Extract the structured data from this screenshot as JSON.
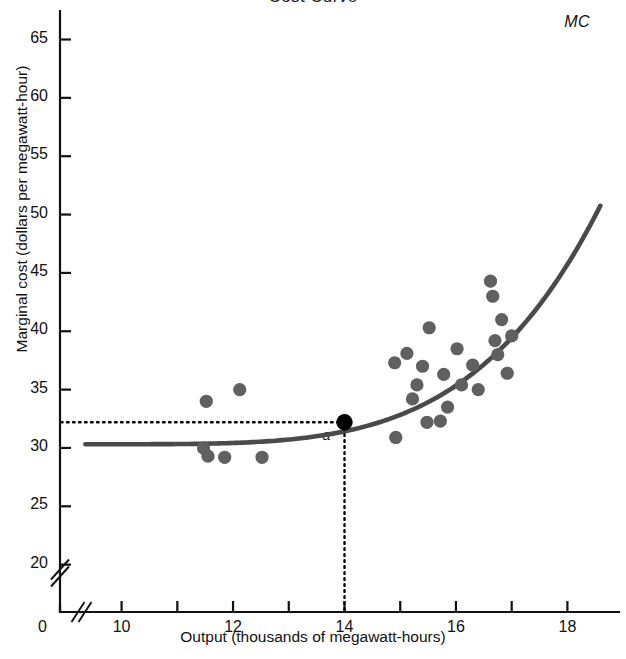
{
  "chart_data": {
    "type": "scatter",
    "title": "Cost Curve",
    "xlabel": "Output (thousands of megawatt-hours)",
    "ylabel": "Marginal cost (dollars per megawatt-hour)",
    "xlim": [
      9.2,
      18.8
    ],
    "ylim": [
      18.0,
      66.5
    ],
    "x_ticks": [
      10,
      11,
      12,
      13,
      14,
      15,
      16,
      17,
      18
    ],
    "x_tick_labels": [
      "10",
      "",
      "12",
      "",
      "14",
      "",
      "16",
      "",
      "18"
    ],
    "y_ticks": [
      20,
      25,
      30,
      35,
      40,
      45,
      50,
      55,
      60,
      65
    ],
    "y_tick_labels": [
      "20",
      "25",
      "30",
      "35",
      "40",
      "45",
      "50",
      "55",
      "60",
      "65"
    ],
    "origin_label": "0",
    "axis_break_x": true,
    "axis_break_y": true,
    "grid": false,
    "legend": null,
    "series": [
      {
        "name": "Observed marginal cost",
        "type": "scatter",
        "marker": "filled-circle",
        "color": "#606060",
        "points": [
          [
            11.52,
            34.0
          ],
          [
            11.47,
            30.0
          ],
          [
            11.55,
            29.3
          ],
          [
            11.85,
            29.2
          ],
          [
            12.12,
            35.0
          ],
          [
            12.52,
            29.2
          ],
          [
            14.9,
            37.3
          ],
          [
            14.92,
            30.9
          ],
          [
            15.12,
            38.1
          ],
          [
            15.22,
            34.2
          ],
          [
            15.3,
            35.4
          ],
          [
            15.4,
            37.0
          ],
          [
            15.48,
            32.2
          ],
          [
            15.52,
            40.3
          ],
          [
            15.72,
            32.3
          ],
          [
            15.78,
            36.3
          ],
          [
            15.85,
            33.5
          ],
          [
            16.02,
            38.5
          ],
          [
            16.1,
            35.4
          ],
          [
            16.3,
            37.1
          ],
          [
            16.4,
            35.0
          ],
          [
            16.62,
            44.3
          ],
          [
            16.66,
            43.0
          ],
          [
            16.7,
            39.2
          ],
          [
            16.75,
            38.0
          ],
          [
            16.82,
            41.0
          ],
          [
            16.92,
            36.4
          ],
          [
            17.0,
            39.6
          ]
        ]
      },
      {
        "name": "MC",
        "type": "line",
        "color": "#4a4a4a",
        "label": "MC",
        "description": "Marginal cost curve rising from about 30.3 at output 9.4 to about 66 at output 18.6"
      }
    ],
    "annotations": [
      {
        "name": "point-a",
        "label": "a",
        "x": 14.0,
        "y": 32.2,
        "marker": "filled-circle",
        "color": "#000000",
        "guide_lines": "dotted horizontal to y-axis and dotted vertical to x-axis"
      }
    ]
  },
  "labels": {
    "mc_curve": "MC",
    "point_a": "a"
  },
  "colors": {
    "curve": "#4a4a4a",
    "scatter": "#606060",
    "point_a": "#000000",
    "axis": "#111111",
    "guide": "#000000"
  }
}
